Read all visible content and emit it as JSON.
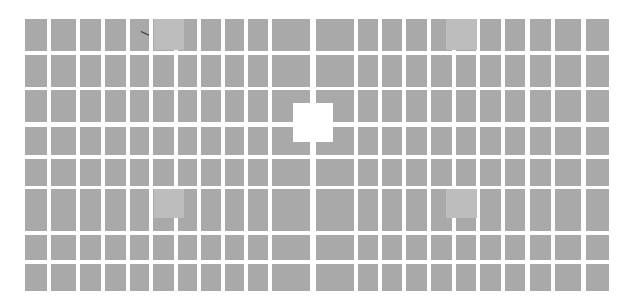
{
  "image": {
    "description": "Grid of gray rectangular tiles on white background with four lighter tiles and a white square in the center",
    "colors": {
      "background": "#ffffff",
      "tile": "#a9a9a9",
      "light_tile": "#bdbdbd"
    },
    "columns": [
      [
        25,
        47
      ],
      [
        51,
        76
      ],
      [
        80,
        101
      ],
      [
        105,
        126
      ],
      [
        130,
        149
      ],
      [
        153,
        174
      ],
      [
        178,
        197
      ],
      [
        201,
        221
      ],
      [
        225,
        244
      ],
      [
        248,
        268
      ],
      [
        272,
        310
      ],
      [
        316,
        354
      ],
      [
        358,
        378
      ],
      [
        382,
        402
      ],
      [
        406,
        427
      ],
      [
        431,
        452
      ],
      [
        456,
        476
      ],
      [
        480,
        501
      ],
      [
        505,
        525
      ],
      [
        530,
        551
      ],
      [
        555,
        581
      ],
      [
        586,
        609
      ]
    ],
    "rows": [
      [
        19,
        51
      ],
      [
        55,
        87
      ],
      [
        90,
        122
      ],
      [
        127,
        155
      ],
      [
        159,
        186
      ],
      [
        189,
        231
      ],
      [
        235,
        260
      ],
      [
        264,
        291
      ]
    ],
    "light_tiles": [
      {
        "x": 154,
        "y": 19,
        "w": 30,
        "h": 31
      },
      {
        "x": 446,
        "y": 19,
        "w": 31,
        "h": 31
      },
      {
        "x": 154,
        "y": 189,
        "w": 30,
        "h": 29
      },
      {
        "x": 446,
        "y": 189,
        "w": 31,
        "h": 29
      }
    ],
    "center_hole": {
      "x": 293,
      "y": 103,
      "w": 40,
      "h": 39
    }
  }
}
